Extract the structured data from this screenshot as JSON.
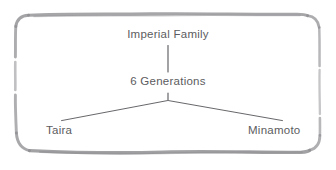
{
  "diagram": {
    "style": "hand-drawn sketch frame",
    "frame": {
      "stroke_color": "#8d8d91",
      "shape": "rounded-rectangle"
    },
    "text_color": "#5c5c60",
    "connector_color": "#5f5f63",
    "background_color": "#ffffff",
    "nodes": {
      "root": "Imperial Family",
      "middle": "6 Generations",
      "leaf_left": "Taira",
      "leaf_right": "Minamoto"
    },
    "connectors": [
      {
        "name": "root-to-middle",
        "type": "vertical"
      },
      {
        "name": "middle-stub",
        "type": "vertical"
      },
      {
        "name": "middle-to-leaf-left",
        "type": "diagonal"
      },
      {
        "name": "middle-to-leaf-right",
        "type": "diagonal"
      }
    ]
  }
}
